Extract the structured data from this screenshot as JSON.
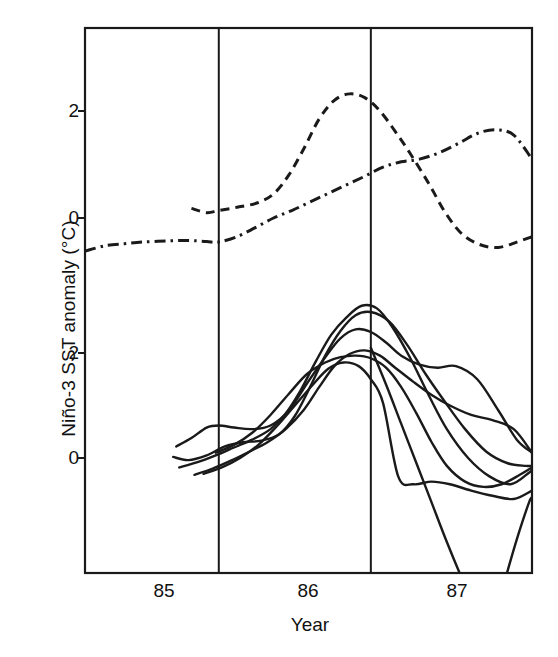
{
  "chart_data": {
    "type": "line",
    "title": "",
    "xlabel": "Year",
    "ylabel": "Niño-3 SST anomaly (°C)",
    "grid": "vertical-year-boundaries",
    "legend": "none",
    "x_tick_labels": [
      "85",
      "86",
      "87"
    ],
    "x_tick_values": [
      85.0,
      86.0,
      87.0
    ],
    "xlim": [
      84.62,
      87.56
    ],
    "y_tick_labels_upper": [
      "2",
      "0"
    ],
    "y_tick_values_upper": [
      2,
      0
    ],
    "y_tick_labels_lower": [
      "2",
      "0"
    ],
    "y_tick_values_lower": [
      2,
      0
    ],
    "note": "Two stacked panels share one frame: upper panel shows observed/analysis curves (dashed and dash-dot), lower panel shows an ensemble of six solid forecast trajectories.",
    "series": [
      {
        "name": "dashed-observed",
        "style": "dashed",
        "panel": "upper",
        "x": [
          85.32,
          85.42,
          85.5,
          85.62,
          85.75,
          85.86,
          85.96,
          86.06,
          86.16,
          86.26,
          86.36,
          86.46,
          86.56,
          86.66,
          86.76,
          86.88,
          86.99,
          87.1,
          87.22,
          87.34,
          87.46,
          87.56
        ],
        "y": [
          0.18,
          0.1,
          0.14,
          0.2,
          0.28,
          0.45,
          0.8,
          1.3,
          1.85,
          2.2,
          2.32,
          2.25,
          2.0,
          1.62,
          1.2,
          0.65,
          0.1,
          -0.3,
          -0.5,
          -0.55,
          -0.45,
          -0.35
        ]
      },
      {
        "name": "dash-dot-observed",
        "style": "dash-dot",
        "panel": "upper",
        "x": [
          84.62,
          84.75,
          84.88,
          85.0,
          85.15,
          85.3,
          85.42,
          85.5,
          85.62,
          85.74,
          85.86,
          85.98,
          86.1,
          86.22,
          86.34,
          86.46,
          86.58,
          86.7,
          86.82,
          86.95,
          87.08,
          87.2,
          87.32,
          87.44,
          87.56
        ],
        "y": [
          -0.62,
          -0.52,
          -0.48,
          -0.45,
          -0.43,
          -0.42,
          -0.44,
          -0.45,
          -0.35,
          -0.18,
          0.0,
          0.14,
          0.3,
          0.46,
          0.62,
          0.78,
          0.95,
          1.05,
          1.1,
          1.22,
          1.4,
          1.58,
          1.65,
          1.55,
          1.1
        ]
      },
      {
        "name": "forecast-member-1",
        "style": "solid",
        "panel": "lower",
        "x": [
          85.22,
          85.32,
          85.42,
          85.5,
          85.6,
          85.72,
          85.84,
          85.96,
          86.08,
          86.2,
          86.3,
          86.4,
          86.5,
          86.6,
          86.7,
          86.82,
          86.94,
          87.06,
          87.2,
          87.34,
          87.46,
          87.56
        ],
        "y": [
          0.22,
          0.38,
          0.58,
          0.62,
          0.58,
          0.55,
          0.62,
          0.9,
          1.42,
          1.92,
          2.28,
          2.45,
          2.4,
          2.2,
          1.95,
          1.78,
          1.72,
          1.75,
          1.5,
          0.9,
          0.35,
          0.1
        ]
      },
      {
        "name": "forecast-member-2",
        "style": "solid",
        "panel": "lower",
        "x": [
          85.2,
          85.3,
          85.42,
          85.54,
          85.66,
          85.78,
          85.9,
          86.0,
          86.1,
          86.2,
          86.3,
          86.4,
          86.5,
          86.62,
          86.74,
          86.86,
          86.98,
          87.12,
          87.26,
          87.4,
          87.52,
          87.56
        ],
        "y": [
          0.02,
          -0.04,
          0.05,
          0.22,
          0.3,
          0.33,
          0.46,
          0.8,
          1.35,
          1.95,
          2.42,
          2.72,
          2.78,
          2.6,
          2.15,
          1.6,
          1.1,
          0.55,
          0.12,
          -0.1,
          -0.15,
          -0.15
        ]
      },
      {
        "name": "forecast-member-3",
        "style": "solid",
        "panel": "lower",
        "x": [
          85.24,
          85.36,
          85.48,
          85.6,
          85.72,
          85.84,
          85.94,
          86.04,
          86.14,
          86.24,
          86.34,
          86.44,
          86.54,
          86.64,
          86.76,
          86.88,
          87.0,
          87.14,
          87.28,
          87.42,
          87.54,
          87.56
        ],
        "y": [
          -0.18,
          -0.08,
          0.05,
          0.2,
          0.35,
          0.55,
          0.85,
          1.3,
          1.85,
          2.35,
          2.68,
          2.9,
          2.85,
          2.5,
          1.9,
          1.2,
          0.55,
          0.0,
          -0.35,
          -0.5,
          -0.28,
          -0.22
        ]
      },
      {
        "name": "forecast-member-4",
        "style": "solid",
        "panel": "lower",
        "x": [
          85.34,
          85.46,
          85.58,
          85.7,
          85.82,
          85.94,
          86.06,
          86.16,
          86.26,
          86.36,
          86.46,
          86.56,
          86.66,
          86.78,
          86.9,
          87.02,
          87.16,
          87.3,
          87.44,
          87.56
        ],
        "y": [
          -0.32,
          -0.2,
          -0.05,
          0.12,
          0.3,
          0.55,
          0.92,
          1.35,
          1.75,
          1.98,
          2.05,
          1.95,
          1.72,
          1.45,
          1.2,
          1.0,
          0.82,
          0.72,
          0.55,
          0.1
        ]
      },
      {
        "name": "forecast-member-5",
        "style": "solid",
        "panel": "lower",
        "x": [
          85.48,
          85.6,
          85.72,
          85.84,
          85.96,
          86.08,
          86.2,
          86.3,
          86.4,
          86.5,
          86.6,
          86.7,
          86.8,
          86.9,
          87.0,
          87.12,
          87.24,
          87.36,
          87.48,
          87.56
        ],
        "y": [
          0.1,
          0.25,
          0.48,
          0.82,
          1.22,
          1.6,
          1.82,
          1.92,
          1.95,
          1.9,
          1.72,
          1.35,
          0.85,
          0.3,
          -0.15,
          -0.45,
          -0.55,
          -0.5,
          -0.32,
          -0.18
        ]
      },
      {
        "name": "forecast-member-6",
        "style": "solid",
        "panel": "lower",
        "x": [
          85.4,
          85.52,
          85.64,
          85.76,
          85.88,
          86.0,
          86.12,
          86.22,
          86.32,
          86.42,
          86.5,
          86.58,
          86.68,
          86.78,
          86.9,
          87.02,
          87.16,
          87.3,
          87.44,
          87.56
        ],
        "y": [
          -0.3,
          -0.18,
          0.0,
          0.25,
          0.6,
          1.0,
          1.4,
          1.7,
          1.82,
          1.75,
          1.5,
          1.05,
          -0.35,
          -0.5,
          -0.45,
          -0.5,
          -0.62,
          -0.72,
          -0.78,
          -0.62
        ]
      },
      {
        "name": "forecast-member-7",
        "style": "solid",
        "panel": "lower",
        "x": [
          86.5,
          86.6,
          86.7,
          86.8,
          86.9,
          87.0,
          87.1,
          87.2,
          87.3,
          87.42,
          87.5
        ],
        "y": [
          2.1,
          1.4,
          0.65,
          -0.1,
          -0.85,
          -1.6,
          -2.3,
          -2.95,
          -3.2,
          -3.15,
          -3.3
        ]
      },
      {
        "name": "forecast-member-8",
        "style": "solid",
        "panel": "lower",
        "x": [
          87.3,
          87.38,
          87.46,
          87.54,
          87.56
        ],
        "y": [
          -3.2,
          -2.35,
          -1.55,
          -0.85,
          -0.75
        ]
      }
    ]
  },
  "axes": {
    "x_ticks": [
      {
        "label": "85",
        "value": 85.0
      },
      {
        "label": "86",
        "value": 86.0
      },
      {
        "label": "87",
        "value": 87.0
      }
    ],
    "y_ticks": [
      {
        "label": "2",
        "value": 2,
        "panel": "upper"
      },
      {
        "label": "0",
        "value": 0,
        "panel": "upper"
      },
      {
        "label": "2",
        "value": 2,
        "panel": "lower"
      },
      {
        "label": "0",
        "value": 0,
        "panel": "lower"
      }
    ],
    "x_axis_title": "Year",
    "y_axis_title": "Niño-3 SST anomaly (°C)"
  },
  "colors": {
    "line": "#1a1a1a",
    "frame": "#1a1a1a",
    "background": "#ffffff",
    "text": "#111111"
  }
}
